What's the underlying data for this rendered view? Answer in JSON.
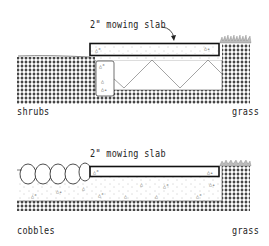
{
  "diagram": {
    "top": {
      "slab_label": "2\" mowing slab",
      "left_label": "shrubs",
      "right_label": "grass"
    },
    "bottom": {
      "slab_label": "2\" mowing slab",
      "left_label": "cobbles",
      "right_label": "grass"
    }
  }
}
